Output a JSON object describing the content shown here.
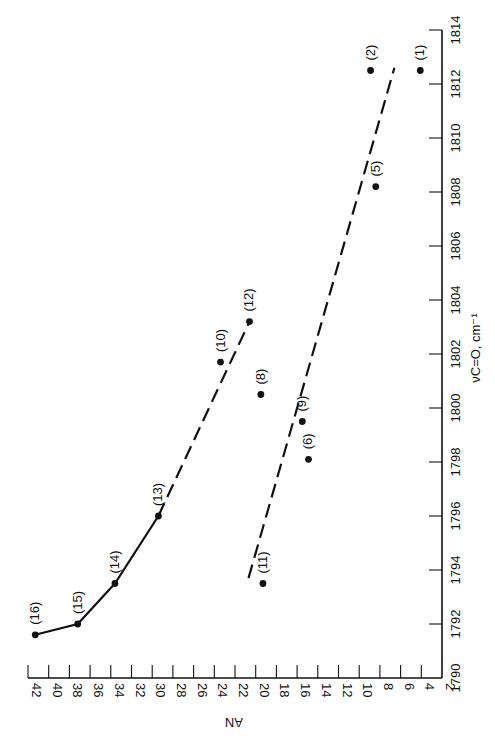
{
  "chart_data": {
    "type": "scatter",
    "title": "",
    "orientation_note": "figure printed rotated 90 degrees",
    "x_axis": {
      "label": "νC=O, cm⁻¹",
      "range": [
        1790,
        1814
      ],
      "ticks": [
        1790,
        1792,
        1794,
        1796,
        1798,
        1800,
        1802,
        1804,
        1806,
        1808,
        1810,
        1812,
        1814
      ]
    },
    "y_axis": {
      "label": "AN",
      "range": [
        2,
        42
      ],
      "ticks": [
        2,
        4,
        6,
        8,
        10,
        12,
        14,
        16,
        18,
        20,
        22,
        24,
        26,
        28,
        30,
        32,
        34,
        36,
        38,
        40,
        42
      ]
    },
    "grid": false,
    "legend": null,
    "points": [
      {
        "label": "(1)",
        "nu": 1812.5,
        "AN": 4.1
      },
      {
        "label": "(2)",
        "nu": 1812.5,
        "AN": 8.9
      },
      {
        "label": "(5)",
        "nu": 1808.2,
        "AN": 8.4
      },
      {
        "label": "(6)",
        "nu": 1798.1,
        "AN": 14.9
      },
      {
        "label": "(8)",
        "nu": 1800.5,
        "AN": 19.5
      },
      {
        "label": "(9)",
        "nu": 1799.5,
        "AN": 15.5
      },
      {
        "label": "(10)",
        "nu": 1801.7,
        "AN": 23.4
      },
      {
        "label": "(11)",
        "nu": 1793.5,
        "AN": 19.3
      },
      {
        "label": "(12)",
        "nu": 1803.2,
        "AN": 20.6
      },
      {
        "label": "(13)",
        "nu": 1796.0,
        "AN": 29.4
      },
      {
        "label": "(14)",
        "nu": 1793.5,
        "AN": 33.6
      },
      {
        "label": "(15)",
        "nu": 1792.0,
        "AN": 37.2
      },
      {
        "label": "(16)",
        "nu": 1791.6,
        "AN": 41.3
      }
    ],
    "series": [
      {
        "name": "solid-curve",
        "style": "solid",
        "points": [
          [
            1791.6,
            41.3
          ],
          [
            1792.0,
            37.2
          ],
          [
            1793.5,
            33.6
          ],
          [
            1796.0,
            29.4
          ]
        ]
      },
      {
        "name": "upper-dashed-extension",
        "style": "dashed",
        "points": [
          [
            1796.0,
            29.4
          ],
          [
            1803.2,
            20.6
          ]
        ]
      },
      {
        "name": "lower-dashed-fit",
        "style": "dashed",
        "points": [
          [
            1793.7,
            20.7
          ],
          [
            1812.6,
            6.6
          ]
        ]
      }
    ]
  }
}
